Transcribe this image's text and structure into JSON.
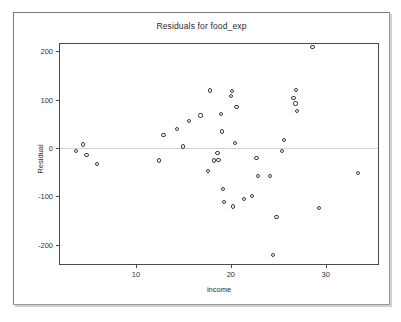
{
  "chart_data": {
    "type": "scatter",
    "title": "Residuals for food_exp",
    "xlabel": "income",
    "ylabel": "Residual",
    "xlim": [
      2,
      35.5
    ],
    "ylim": [
      -240,
      215
    ],
    "xticks": [
      10,
      20,
      30
    ],
    "yticks": [
      200,
      100,
      0,
      -100,
      -200
    ],
    "xticklabels": [
      "10",
      "20",
      "30"
    ],
    "yticklabels": [
      "200",
      "100",
      "0",
      "-100",
      "-200"
    ],
    "grid": false,
    "legend": null,
    "reference_line": {
      "y": 0,
      "color": "#d2d2d2"
    },
    "marker": {
      "shape": "circle",
      "filled": false,
      "edge_color": "#3d3d3d",
      "size": 4
    },
    "points": [
      {
        "x": 3.7,
        "y": -7
      },
      {
        "x": 4.4,
        "y": 7
      },
      {
        "x": 4.8,
        "y": -14
      },
      {
        "x": 5.9,
        "y": -33
      },
      {
        "x": 12.4,
        "y": -26
      },
      {
        "x": 12.9,
        "y": 26
      },
      {
        "x": 14.3,
        "y": 39
      },
      {
        "x": 15.0,
        "y": 3
      },
      {
        "x": 15.6,
        "y": 55
      },
      {
        "x": 16.8,
        "y": 67
      },
      {
        "x": 17.6,
        "y": -47
      },
      {
        "x": 17.8,
        "y": 119
      },
      {
        "x": 18.2,
        "y": -26
      },
      {
        "x": 18.6,
        "y": -11
      },
      {
        "x": 18.7,
        "y": -25
      },
      {
        "x": 19.0,
        "y": 70
      },
      {
        "x": 19.1,
        "y": 34
      },
      {
        "x": 19.2,
        "y": -85
      },
      {
        "x": 19.3,
        "y": -112
      },
      {
        "x": 20.0,
        "y": 108
      },
      {
        "x": 20.1,
        "y": 118
      },
      {
        "x": 20.2,
        "y": -121
      },
      {
        "x": 20.4,
        "y": 11
      },
      {
        "x": 20.6,
        "y": 85
      },
      {
        "x": 21.4,
        "y": -106
      },
      {
        "x": 22.2,
        "y": -100
      },
      {
        "x": 22.7,
        "y": -21
      },
      {
        "x": 22.9,
        "y": -58
      },
      {
        "x": 24.1,
        "y": -58
      },
      {
        "x": 24.4,
        "y": -222
      },
      {
        "x": 24.8,
        "y": -142
      },
      {
        "x": 25.4,
        "y": -7
      },
      {
        "x": 25.6,
        "y": 17
      },
      {
        "x": 26.6,
        "y": 104
      },
      {
        "x": 26.8,
        "y": 92
      },
      {
        "x": 26.9,
        "y": 120
      },
      {
        "x": 27.0,
        "y": 77
      },
      {
        "x": 28.6,
        "y": 209
      },
      {
        "x": 29.3,
        "y": -125
      },
      {
        "x": 33.4,
        "y": -51
      }
    ]
  },
  "colors": {
    "frame": "#4a4a4a",
    "panel_border": "#7b7b7b",
    "text": "#2a2a2a",
    "marker_edge": "#3d3d3d",
    "zero_line": "#d2d2d2",
    "background": "#ffffff"
  }
}
